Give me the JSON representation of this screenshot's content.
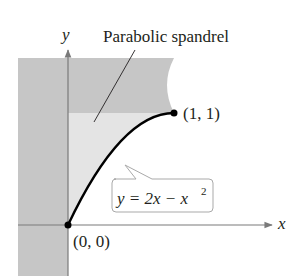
{
  "diagram": {
    "title_label": "Parabolic spandrel",
    "axes": {
      "x_label": "x",
      "y_label": "y"
    },
    "points": [
      {
        "name": "origin",
        "label": "(0, 0)"
      },
      {
        "name": "endpoint",
        "label": "(1, 1)"
      }
    ],
    "equation": {
      "lhs": "y = 2x − x",
      "exponent": "2"
    },
    "colors": {
      "dark_region": "#c6c6c6",
      "light_region": "#e4e4e4",
      "curve": "#000000",
      "axis": "#7a7a7a"
    }
  }
}
